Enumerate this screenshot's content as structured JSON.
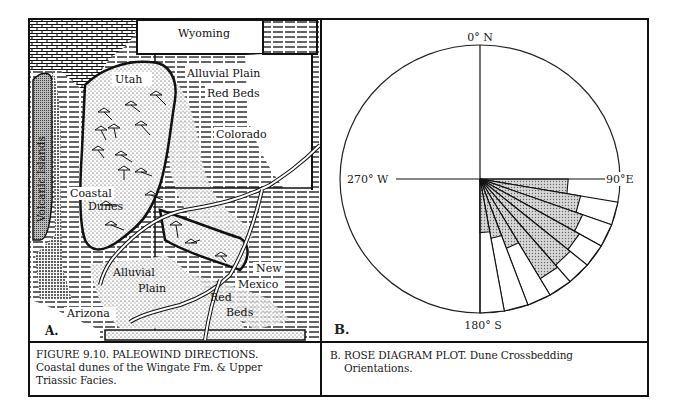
{
  "figure": {
    "panel_a": {
      "label": "A.",
      "map_labels": {
        "wyoming": "Wyoming",
        "utah": "Utah",
        "alluvial_plain_north": "Alluvial Plain",
        "red_beds_north": "Red Beds",
        "colorado": "Colorado",
        "volcanic_islands": "Volcanic Islands",
        "coastal": "Coastal",
        "dunes": "Dunes",
        "alluvial": "Alluvial",
        "plain": "Plain",
        "new": "New",
        "mexico": "Mexico",
        "red": "Red",
        "beds": "Beds",
        "arizona": "Arizona"
      }
    },
    "panel_b": {
      "label": "B.",
      "axis_labels": {
        "north": "0° N",
        "east": "90°E",
        "south": "180° S",
        "west": "270° W"
      }
    },
    "captions": {
      "a_line1": "FIGURE  9.10. PALEOWIND DIRECTIONS.",
      "a_line2": "Coastal dunes of the Wingate Fm. & Upper",
      "a_line3": "Triassic Facies.",
      "b_line1": "B. ROSE DIAGRAM PLOT. Dune Crossbedding",
      "b_line2": "Orientations."
    }
  },
  "chart_data": {
    "type": "rose",
    "title": "B. ROSE DIAGRAM PLOT. Dune Crossbedding Orientations.",
    "axis_labels": [
      "0° N",
      "90°E",
      "180° S",
      "270° W"
    ],
    "sector_width_deg": 10,
    "sectors_deg": [
      [
        90,
        100
      ],
      [
        100,
        110
      ],
      [
        110,
        120
      ],
      [
        120,
        130
      ],
      [
        130,
        140
      ],
      [
        140,
        150
      ],
      [
        150,
        160
      ],
      [
        160,
        170
      ],
      [
        170,
        180
      ]
    ],
    "shaded_radius_fraction": [
      0.63,
      0.73,
      0.78,
      0.82,
      0.84,
      0.86,
      0.55,
      0.45,
      0.4
    ],
    "outer_radius_fraction": [
      0.63,
      1.0,
      1.0,
      1.0,
      1.0,
      1.0,
      1.0,
      1.0,
      1.0
    ],
    "dominant_direction": "ESE to SSE (90°–180°)",
    "colors": {
      "shaded": "#9a9a9a",
      "outline": "#111111"
    }
  }
}
